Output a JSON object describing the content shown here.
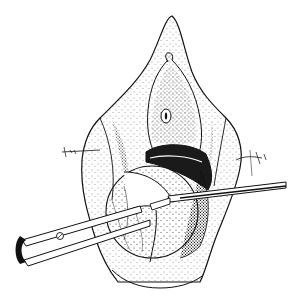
{
  "figure": {
    "type": "surgical-illustration",
    "style": "black-and-white stipple line drawing",
    "colors": {
      "background": "#ffffff",
      "ink": "#111111",
      "shade": "#3a3a3a",
      "cavity": "#1a1a1a"
    },
    "elements": [
      "tissue-outline",
      "central-orifice",
      "dark-cavity",
      "retracted-membrane",
      "left-suture",
      "right-suture",
      "scissors",
      "forceps"
    ]
  }
}
